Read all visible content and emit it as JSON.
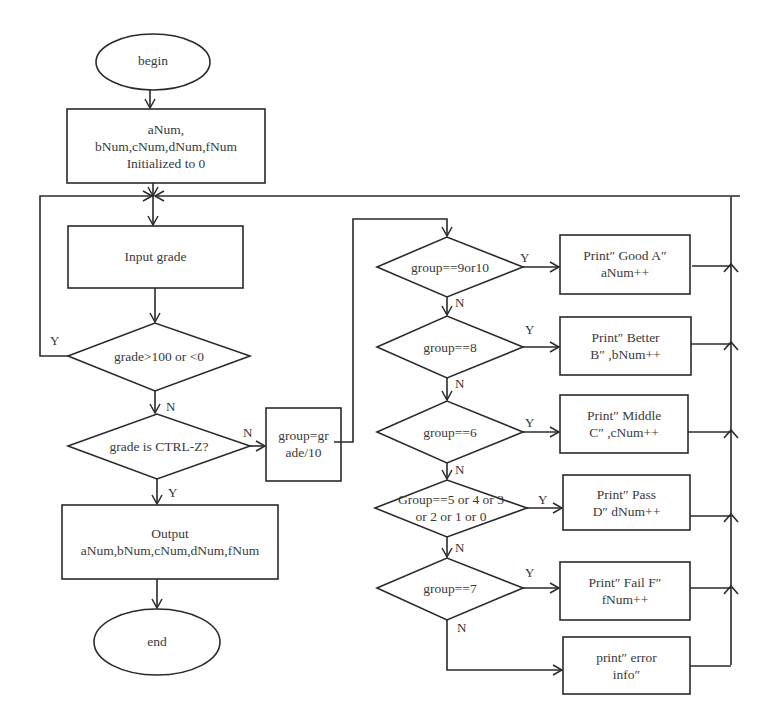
{
  "diagram": {
    "type": "flowchart",
    "nodes": {
      "begin": {
        "label": "begin",
        "shape": "ellipse"
      },
      "init": {
        "lines": [
          "aNum,",
          "bNum,cNum,dNum,fNum",
          "Initialized to 0"
        ],
        "shape": "process"
      },
      "input": {
        "label": "Input grade",
        "shape": "process"
      },
      "check_range": {
        "label": "grade>100 or <0",
        "shape": "decision"
      },
      "check_eof": {
        "label": "grade is CTRL-Z?",
        "shape": "decision"
      },
      "compute_group": {
        "lines": [
          "group=gr",
          "ade/10"
        ],
        "shape": "process"
      },
      "output": {
        "lines": [
          "Output",
          "aNum,bNum,cNum,dNum,fNum"
        ],
        "shape": "process"
      },
      "end": {
        "label": "end",
        "shape": "ellipse"
      },
      "d_a": {
        "label": "group==9or10",
        "shape": "decision"
      },
      "d_b": {
        "label": "group==8",
        "shape": "decision"
      },
      "d_c": {
        "label": "group==6",
        "shape": "decision"
      },
      "d_d": {
        "lines": [
          "Group==5 or 4 or 3",
          "or 2 or 1 or 0"
        ],
        "shape": "decision"
      },
      "d_f": {
        "label": "group==7",
        "shape": "decision"
      },
      "p_a": {
        "lines": [
          "Print″  Good A″",
          "aNum++"
        ],
        "shape": "process"
      },
      "p_b": {
        "lines": [
          "Print″  Better",
          "B″  ,bNum++"
        ],
        "shape": "process"
      },
      "p_c": {
        "lines": [
          "Print″  Middle",
          "C″  ,cNum++"
        ],
        "shape": "process"
      },
      "p_d": {
        "lines": [
          "Print″  Pass",
          "D″  dNum++"
        ],
        "shape": "process"
      },
      "p_f": {
        "lines": [
          "Print″  Fail F″",
          "fNum++"
        ],
        "shape": "process"
      },
      "p_err": {
        "lines": [
          "print″  error",
          "info″"
        ],
        "shape": "process"
      }
    },
    "edge_labels": {
      "range_yes": "Y",
      "range_no": "N",
      "eof_no": "N",
      "eof_yes": "Y",
      "a_yes": "Y",
      "a_no": "N",
      "b_yes": "Y",
      "b_no": "N",
      "c_yes": "Y",
      "c_no": "N",
      "d_yes": "Y",
      "d_no": "N",
      "f_yes": "Y",
      "f_no": "N"
    }
  }
}
